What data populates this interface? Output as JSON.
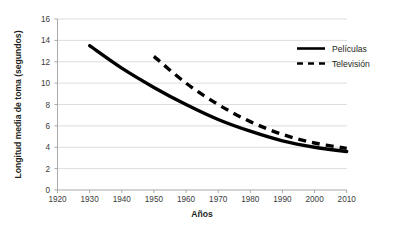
{
  "chart_data": {
    "type": "line",
    "title": "",
    "xlabel": "Años",
    "ylabel": "Longitud media de toma (segundos)",
    "xlim": [
      1920,
      2010
    ],
    "ylim": [
      0,
      16
    ],
    "xticks": [
      "1920",
      "1930",
      "1940",
      "1950",
      "1960",
      "1970",
      "1980",
      "1990",
      "2000",
      "2010"
    ],
    "yticks": [
      "0",
      "2",
      "4",
      "6",
      "8",
      "10",
      "12",
      "14",
      "16"
    ],
    "grid": "horizontal",
    "legend_position": "top-right",
    "series": [
      {
        "name": "Películas",
        "style": "solid",
        "color": "#000000",
        "x": [
          1930,
          1940,
          1950,
          1960,
          1970,
          1980,
          1990,
          2000,
          2010
        ],
        "values": [
          13.5,
          11.4,
          9.6,
          8.0,
          6.6,
          5.5,
          4.6,
          4.0,
          3.6
        ]
      },
      {
        "name": "Televisión",
        "style": "dashed",
        "color": "#000000",
        "x": [
          1950,
          1960,
          1970,
          1980,
          1990,
          2000,
          2010
        ],
        "values": [
          12.5,
          10.0,
          8.0,
          6.4,
          5.2,
          4.4,
          3.9
        ]
      }
    ]
  },
  "axes": {
    "y_title": "Longitud media de toma (segundos)",
    "x_title": "Años",
    "y_tick_0": "0",
    "y_tick_1": "2",
    "y_tick_2": "4",
    "y_tick_3": "6",
    "y_tick_4": "8",
    "y_tick_5": "10",
    "y_tick_6": "12",
    "y_tick_7": "14",
    "y_tick_8": "16",
    "x_tick_0": "1920",
    "x_tick_1": "1930",
    "x_tick_2": "1940",
    "x_tick_3": "1950",
    "x_tick_4": "1960",
    "x_tick_5": "1970",
    "x_tick_6": "1980",
    "x_tick_7": "1990",
    "x_tick_8": "2000",
    "x_tick_9": "2010"
  },
  "legend": {
    "entry_0_label": "Películas",
    "entry_1_label": "Televisión"
  },
  "colors": {
    "line": "#000000",
    "grid": "#d4d4d4",
    "axis": "#b5b5b5",
    "text": "#231f20",
    "background": "#ffffff"
  }
}
